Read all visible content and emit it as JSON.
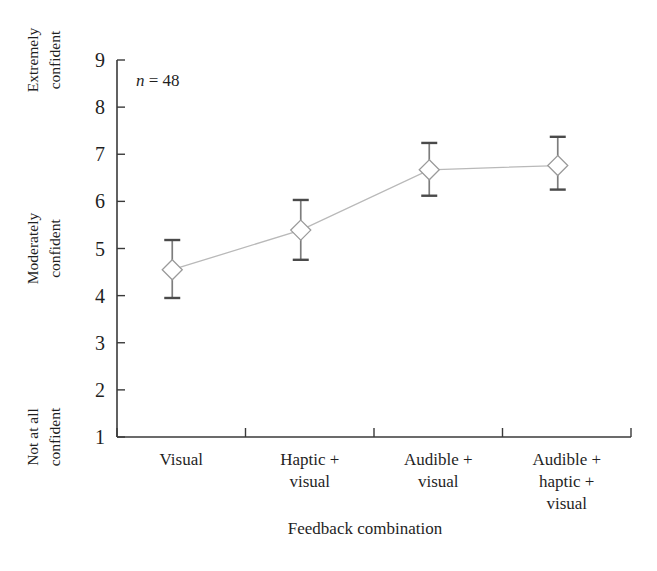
{
  "chart_data": {
    "type": "line",
    "title": "",
    "subtitle": "",
    "xlabel": "Feedback combination",
    "ylabel": "",
    "categories": [
      "Visual",
      "Haptic +\nvisual",
      "Audible +\nvisual",
      "Audible +\nhaptic +\nvisual"
    ],
    "category_lines": [
      [
        "Visual"
      ],
      [
        "Haptic +",
        "visual"
      ],
      [
        "Audible +",
        "visual"
      ],
      [
        "Audible +",
        "haptic +",
        "visual"
      ]
    ],
    "values": [
      4.55,
      5.39,
      6.67,
      6.76
    ],
    "error_low": [
      3.95,
      4.76,
      6.12,
      6.25
    ],
    "error_high": [
      5.18,
      6.03,
      7.24,
      7.37
    ],
    "ylim": [
      1,
      9
    ],
    "ytick_values": [
      1,
      2,
      3,
      4,
      5,
      6,
      7,
      8,
      9
    ],
    "ytick_labels": [
      "1",
      "2",
      "3",
      "4",
      "5",
      "6",
      "7",
      "8",
      "9"
    ],
    "y_anchor_labels": [
      {
        "value": 9,
        "lines": [
          "Extremely",
          "confident"
        ]
      },
      {
        "value": 5,
        "lines": [
          "Moderately",
          "confident"
        ]
      },
      {
        "value": 1,
        "lines": [
          "Not at all",
          "confident"
        ]
      }
    ],
    "grid": false,
    "legend": "none",
    "marker": "open-diamond",
    "annotations": [
      {
        "name": "sample-size",
        "text_italic": "n",
        "text_rest": " = 48",
        "full": "n = 48"
      }
    ]
  },
  "annotation": {
    "n_symbol": "n",
    "n_value": " = 48"
  },
  "axes": {
    "x_title": "Feedback combination"
  },
  "colors": {
    "axis": "#3a3a3a",
    "line": "#b9b9b9",
    "marker_stroke": "#9a9a9a",
    "marker_fill": "#ffffff",
    "error": "#7d7d7d",
    "text": "#1f1f1f",
    "background": "#ffffff"
  }
}
